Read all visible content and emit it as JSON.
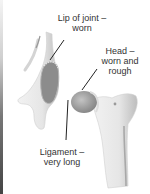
{
  "diagram": {
    "labels": [
      {
        "id": "lip",
        "line1": "Lip of joint –",
        "line2": "worn"
      },
      {
        "id": "head",
        "line1": "Head –",
        "line2": "worn and",
        "line3": "rough"
      },
      {
        "id": "ligament",
        "line1": "Ligament –",
        "line2": "very long"
      }
    ]
  },
  "colors": {
    "background": "#ffffff",
    "bone": "#ebebeb",
    "bone_shadow": "#a8a8a8",
    "socket": "#8c8c8c",
    "leader_line": "#222222",
    "text": "#333333"
  }
}
